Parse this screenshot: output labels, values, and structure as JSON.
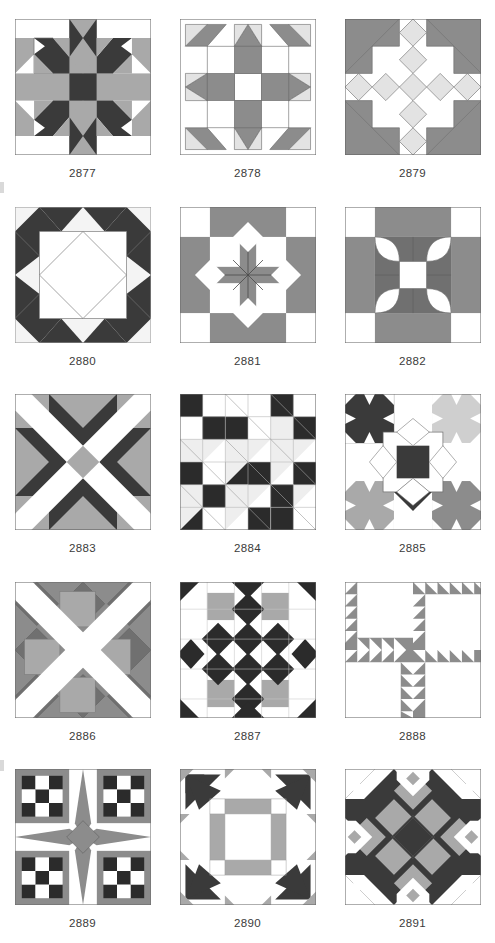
{
  "page": {
    "background": "#ffffff",
    "columns": 3,
    "rows": 5
  },
  "palette": {
    "white": "#ffffff",
    "offwhite": "#f4f4f4",
    "light_gray": "#e3e3e3",
    "mid_gray": "#a9a9a9",
    "gray": "#8c8c8c",
    "dark_gray": "#707070",
    "charcoal": "#3a3a3a",
    "black": "#2b2b2b",
    "outline": "#6b6b6b",
    "label_text": "#3b3b3b"
  },
  "blocks": [
    {
      "id": "2877",
      "label": "2877",
      "name": "carpenter-star-cross",
      "row": 1,
      "col": 1,
      "colors_used": [
        "white",
        "mid_gray",
        "charcoal"
      ],
      "description": "Dark eight-point star arms with gray cross bars and dark center square"
    },
    {
      "id": "2878",
      "label": "2878",
      "name": "lemoyne-star-ring",
      "row": 1,
      "col": 2,
      "colors_used": [
        "white",
        "light_gray",
        "gray"
      ],
      "description": "Gray ring with light gray diamond star points around a white center"
    },
    {
      "id": "2879",
      "label": "2879",
      "name": "sawtooth-diamond-cross",
      "row": 1,
      "col": 3,
      "colors_used": [
        "white",
        "light_gray",
        "gray"
      ],
      "description": "Gray corner triangles with light gray diamond chain cross"
    },
    {
      "id": "2880",
      "label": "2880",
      "name": "square-in-diamond-star",
      "row": 2,
      "col": 1,
      "colors_used": [
        "offwhite",
        "white",
        "charcoal"
      ],
      "description": "Dark star points around a large white square containing an outlined diamond"
    },
    {
      "id": "2881",
      "label": "2881",
      "name": "pinwheel-star-nine-patch",
      "row": 2,
      "col": 2,
      "colors_used": [
        "white",
        "gray"
      ],
      "description": "Gray eight-pointed star with white squares and on-point diamonds"
    },
    {
      "id": "2882",
      "label": "2882",
      "name": "orange-peel-four-patch",
      "row": 2,
      "col": 3,
      "colors_used": [
        "white",
        "mid_gray",
        "dark_gray"
      ],
      "description": "Four curved petal shapes radiating from a white center square"
    },
    {
      "id": "2883",
      "label": "2883",
      "name": "diagonal-x-ribbon",
      "row": 3,
      "col": 1,
      "colors_used": [
        "white",
        "mid_gray",
        "gray",
        "charcoal"
      ],
      "description": "Large diagonal X of white ribbons crossing dark and gray triangles"
    },
    {
      "id": "2884",
      "label": "2884",
      "name": "checkerboard-sawtooth-grid",
      "row": 3,
      "col": 2,
      "colors_used": [
        "white",
        "offwhite",
        "black"
      ],
      "description": "Six by six grid of black and white checkerboard units with pale half-square triangles"
    },
    {
      "id": "2885",
      "label": "2885",
      "name": "four-color-star-medallion",
      "row": 3,
      "col": 3,
      "colors_used": [
        "white",
        "light_gray",
        "mid_gray",
        "gray",
        "charcoal"
      ],
      "description": "Star medallion with dark, light, mid and gray quadrants around a dark center square"
    },
    {
      "id": "2886",
      "label": "2886",
      "name": "crossroads-squares-x",
      "row": 4,
      "col": 1,
      "colors_used": [
        "white",
        "mid_gray",
        "gray",
        "dark_gray"
      ],
      "description": "White diagonal cross over gray on-point squares and triangles"
    },
    {
      "id": "2887",
      "label": "2887",
      "name": "diamond-chain-lattice",
      "row": 4,
      "col": 2,
      "colors_used": [
        "white",
        "mid_gray",
        "black"
      ],
      "description": "Lattice of black on-point diamonds with gray corner squares"
    },
    {
      "id": "2888",
      "label": "2888",
      "name": "sawtooth-l-quadrants",
      "row": 4,
      "col": 3,
      "colors_used": [
        "white",
        "gray"
      ],
      "description": "Four rotated L shaped sawtooth borders around plain white squares"
    },
    {
      "id": "2889",
      "label": "2889",
      "name": "compass-star-checkerboard",
      "row": 5,
      "col": 1,
      "colors_used": [
        "white",
        "gray",
        "black"
      ],
      "description": "Gray four point compass star with black and white checkerboard corners"
    },
    {
      "id": "2890",
      "label": "2890",
      "name": "nine-patch-pinwheel-corners",
      "row": 5,
      "col": 2,
      "colors_used": [
        "white",
        "mid_gray",
        "charcoal"
      ],
      "description": "Gray nine patch center framed by dark pinwheel corner blocks"
    },
    {
      "id": "2891",
      "label": "2891",
      "name": "woven-star-basket",
      "row": 5,
      "col": 3,
      "colors_used": [
        "white",
        "mid_gray",
        "charcoal"
      ],
      "description": "Woven gray bars over a dark eight pointed star"
    }
  ]
}
